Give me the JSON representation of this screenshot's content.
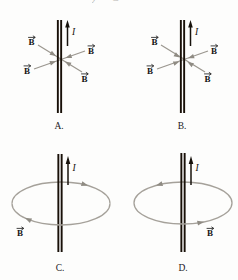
{
  "figure": {
    "top_fragment": "y C",
    "current_label": "I",
    "field_label": "B",
    "colors": {
      "background": "#fdfdfc",
      "wire": "#181008",
      "current_arrow": "#17120c",
      "field_gray": "#9b978f",
      "loop_gray": "#a5a19a",
      "text": "#141414",
      "faint_fragment": "#b6b4af"
    },
    "panels": {
      "a": {
        "caption": "A.",
        "current_direction": "up",
        "description": "Straight vertical wire with upward current I; four B vectors along two lines crossing at the wire, arrowheads near the wire pointing radially inward"
      },
      "b": {
        "caption": "B.",
        "current_direction": "up",
        "description": "Straight vertical wire with upward current I; four B vectors forming an X through the wire, arrowheads clustered at the wire pointing inward"
      },
      "c": {
        "caption": "C.",
        "current_direction": "up",
        "description": "Straight vertical wire with upward current I; circular field line (ellipse in perspective) around the wire, back edge moving right and front edge moving left (clockwise seen from above), B label at lower left"
      },
      "d": {
        "caption": "D.",
        "current_direction": "up",
        "description": "Straight vertical wire with upward current I; circular field line around the wire, back edge moving left and front edge moving right (counterclockwise seen from above), B label at lower right"
      }
    }
  }
}
